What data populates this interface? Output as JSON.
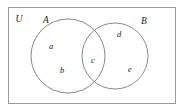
{
  "diagram": {
    "type": "venn-two-set",
    "universe": {
      "label": "U",
      "rect": {
        "x": 8,
        "y": 7,
        "width": 168,
        "height": 97
      }
    },
    "sets": [
      {
        "name": "A",
        "label": "A",
        "label_pos": {
          "x": 46,
          "y": 21
        },
        "circle": {
          "cx": 68,
          "cy": 56,
          "r": 37
        }
      },
      {
        "name": "B",
        "label": "B",
        "label_pos": {
          "x": 144,
          "y": 22
        },
        "circle": {
          "cx": 115,
          "cy": 56,
          "r": 33
        }
      }
    ],
    "elements": [
      {
        "label": "a",
        "region": "A-only",
        "x": 51,
        "y": 47
      },
      {
        "label": "b",
        "region": "A-only",
        "x": 62,
        "y": 71
      },
      {
        "label": "c",
        "region": "A-and-B",
        "x": 93,
        "y": 61
      },
      {
        "label": "d",
        "region": "B-only",
        "x": 119,
        "y": 35
      },
      {
        "label": "e",
        "region": "B-only",
        "x": 130,
        "y": 70
      }
    ],
    "colors": {
      "background": "#ffffff",
      "rect_stroke": "#9a9a9a",
      "circle_stroke": "#7d7d7d",
      "text": "#1a1a1a"
    }
  }
}
